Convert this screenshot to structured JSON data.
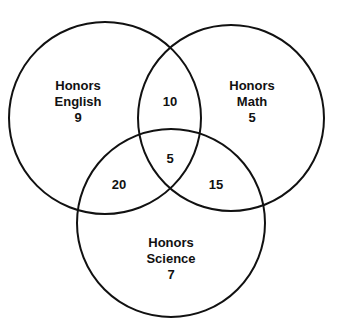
{
  "diagram": {
    "type": "venn",
    "sets": [
      {
        "id": "english",
        "label_line1": "Honors",
        "label_line2": "English",
        "only_count": "9"
      },
      {
        "id": "math",
        "label_line1": "Honors",
        "label_line2": "Math",
        "only_count": "5"
      },
      {
        "id": "science",
        "label_line1": "Honors",
        "label_line2": "Science",
        "only_count": "7"
      }
    ],
    "intersections": {
      "english_math": "10",
      "english_science": "20",
      "math_science": "15",
      "all_three": "5"
    },
    "stroke_color": "#111111",
    "background": "#ffffff"
  }
}
